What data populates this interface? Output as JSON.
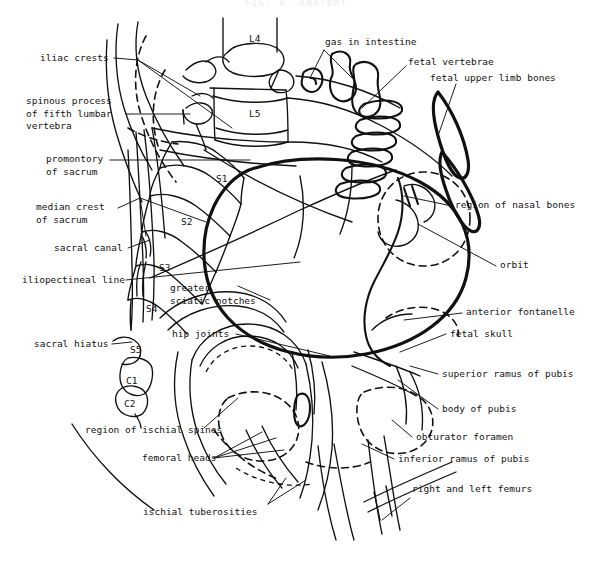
{
  "figure": {
    "header_faint": "FIG. 6. ANATOMY",
    "ink_color": "#111111",
    "background_color": "#ffffff"
  },
  "vertebra_markers": [
    {
      "id": "l4",
      "label": "L4",
      "x": 249,
      "y": 33
    },
    {
      "id": "l5",
      "label": "L5",
      "x": 249,
      "y": 108
    },
    {
      "id": "s1",
      "label": "S1",
      "x": 216,
      "y": 173
    },
    {
      "id": "s2",
      "label": "S2",
      "x": 181,
      "y": 216
    },
    {
      "id": "s3",
      "label": "S3",
      "x": 159,
      "y": 262
    },
    {
      "id": "s4",
      "label": "S4",
      "x": 146,
      "y": 303
    },
    {
      "id": "s5",
      "label": "S5",
      "x": 130,
      "y": 344
    },
    {
      "id": "c1",
      "label": "C1",
      "x": 126,
      "y": 375
    },
    {
      "id": "c2",
      "label": "C2",
      "x": 124,
      "y": 398
    }
  ],
  "labels_left": [
    {
      "id": "iliac-crests",
      "text": "iliac crests",
      "x": 40,
      "y": 56,
      "align": "left"
    },
    {
      "id": "spinous-process",
      "text": "spinous process\nof fifth lumbar\nvertebra",
      "x": 26,
      "y": 96,
      "align": "left"
    },
    {
      "id": "promontory",
      "text": "promontory\nof sacrum",
      "x": 46,
      "y": 154,
      "align": "left"
    },
    {
      "id": "median-crest",
      "text": "median crest\nof sacrum",
      "x": 36,
      "y": 202,
      "align": "left"
    },
    {
      "id": "sacral-canal",
      "text": "sacral canal",
      "x": 54,
      "y": 244,
      "align": "left"
    },
    {
      "id": "iliopectineal",
      "text": "iliopectineal line",
      "x": 22,
      "y": 276,
      "align": "left"
    },
    {
      "id": "sacral-hiatus",
      "text": "sacral hiatus",
      "x": 34,
      "y": 340,
      "align": "left"
    }
  ],
  "labels_center": [
    {
      "id": "gas-in-intestine",
      "text": "gas in intestine",
      "x": 325,
      "y": 40,
      "align": "left"
    },
    {
      "id": "greater-sciatic",
      "text": "greater\nsciatic notches",
      "x": 170,
      "y": 283,
      "align": "left"
    },
    {
      "id": "hip-joints",
      "text": "hip joints",
      "x": 172,
      "y": 330,
      "align": "left"
    },
    {
      "id": "region-ischial-spines",
      "text": "region of ischial spines",
      "x": 85,
      "y": 428,
      "align": "left"
    },
    {
      "id": "femoral-heads",
      "text": "femoral heads",
      "x": 142,
      "y": 455,
      "align": "left"
    },
    {
      "id": "ischial-tuberosities",
      "text": "ischial tuberosities",
      "x": 143,
      "y": 509,
      "align": "left"
    }
  ],
  "labels_right": [
    {
      "id": "fetal-vertebrae",
      "text": "fetal vertebrae",
      "x": 408,
      "y": 60,
      "align": "left"
    },
    {
      "id": "fetal-upper-limb-bones",
      "text": "fetal upper limb bones",
      "x": 430,
      "y": 75,
      "align": "left"
    },
    {
      "id": "region-nasal-bones",
      "text": "region of nasal bones",
      "x": 455,
      "y": 202,
      "align": "left"
    },
    {
      "id": "orbit",
      "text": "orbit",
      "x": 500,
      "y": 262,
      "align": "left"
    },
    {
      "id": "anterior-fontanelle",
      "text": "anterior fontanelle",
      "x": 466,
      "y": 309,
      "align": "left"
    },
    {
      "id": "fetal-skull",
      "text": "fetal skull",
      "x": 450,
      "y": 331,
      "align": "left"
    },
    {
      "id": "superior-ramus-pubis",
      "text": "superior ramus of pubis",
      "x": 442,
      "y": 371,
      "align": "left"
    },
    {
      "id": "body-of-pubis",
      "text": "body of pubis",
      "x": 442,
      "y": 406,
      "align": "left"
    },
    {
      "id": "obturator-foramen",
      "text": "obturator foramen",
      "x": 416,
      "y": 434,
      "align": "left"
    },
    {
      "id": "inferior-ramus-pubis",
      "text": "inferior ramus of pubis",
      "x": 398,
      "y": 456,
      "align": "left"
    },
    {
      "id": "right-and-left-femurs",
      "text": "right and left femurs",
      "x": 412,
      "y": 486,
      "align": "left"
    }
  ]
}
